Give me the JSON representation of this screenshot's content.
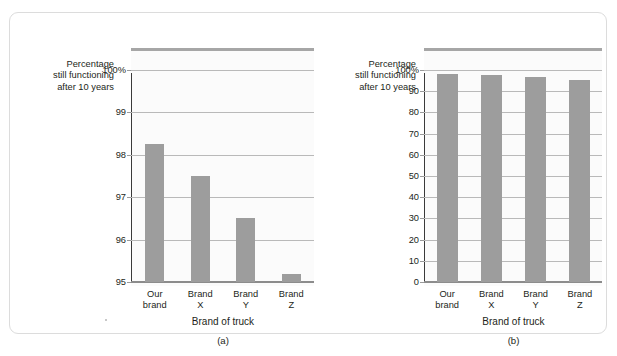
{
  "figure": {
    "bar_color": "#9d9d9d",
    "gridline_color": "#b9b9b9",
    "axis_color": "#3a3a3a",
    "top_rule_color": "#a6a6a6",
    "plot_background": "#fbfbfb",
    "frame_border_color": "#dcdcdc"
  },
  "panel_a": {
    "caption": "(a)",
    "y_caption_lines": [
      "Percentage",
      "still functioning",
      "after 10 years"
    ],
    "x_title": "Brand of truck",
    "x_labels": [
      [
        "Our",
        "brand"
      ],
      [
        "Brand",
        "X"
      ],
      [
        "Brand",
        "Y"
      ],
      [
        "Brand",
        "Z"
      ]
    ],
    "y_ticks": [
      "95",
      "96",
      "97",
      "98",
      "99",
      "100%"
    ]
  },
  "panel_b": {
    "caption": "(b)",
    "y_caption_lines": [
      "Percentage",
      "still functioning",
      "after 10 years"
    ],
    "x_title": "Brand of truck",
    "x_labels": [
      [
        "Our",
        "brand"
      ],
      [
        "Brand",
        "X"
      ],
      [
        "Brand",
        "Y"
      ],
      [
        "Brand",
        "Z"
      ]
    ],
    "y_ticks": [
      "0",
      "10",
      "20",
      "30",
      "40",
      "50",
      "60",
      "70",
      "80",
      "90",
      "100%"
    ]
  },
  "chart_data": [
    {
      "type": "bar",
      "panel": "(a)",
      "title": "",
      "categories": [
        "Our brand",
        "Brand X",
        "Brand Y",
        "Brand Z"
      ],
      "values": [
        98.25,
        97.5,
        96.5,
        95.2
      ],
      "xlabel": "Brand of truck",
      "ylabel": "Percentage still functioning after 10 years",
      "ylim": [
        95,
        100
      ],
      "ytick_values": [
        95,
        96,
        97,
        98,
        99,
        100
      ],
      "ytick_labels": [
        "95",
        "96",
        "97",
        "98",
        "99",
        "100%"
      ],
      "grid": true,
      "legend": "none",
      "note": "Truncated y-axis starting at 95 exaggerates differences between brands."
    },
    {
      "type": "bar",
      "panel": "(b)",
      "title": "",
      "categories": [
        "Our brand",
        "Brand X",
        "Brand Y",
        "Brand Z"
      ],
      "values": [
        98.25,
        97.5,
        96.5,
        95.2
      ],
      "xlabel": "Brand of truck",
      "ylabel": "Percentage still functioning after 10 years",
      "ylim": [
        0,
        100
      ],
      "ytick_values": [
        0,
        10,
        20,
        30,
        40,
        50,
        60,
        70,
        80,
        90,
        100
      ],
      "ytick_labels": [
        "0",
        "10",
        "20",
        "30",
        "40",
        "50",
        "60",
        "70",
        "80",
        "90",
        "100%"
      ],
      "grid": true,
      "legend": "none",
      "note": "Full y-axis starting at 0 shows the brands are nearly identical."
    }
  ]
}
